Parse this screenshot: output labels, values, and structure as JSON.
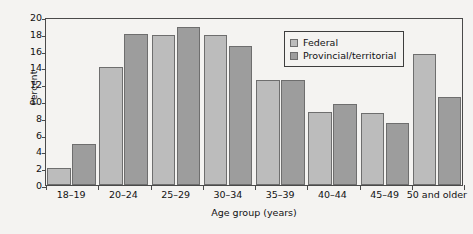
{
  "chart_data": {
    "type": "bar",
    "title": "",
    "subtitle": "",
    "xlabel": "Age group (years)",
    "ylabel": "Percent",
    "categories": [
      "18–19",
      "20–24",
      "25–29",
      "30–34",
      "35–39",
      "40–44",
      "45–49",
      "50 and older"
    ],
    "series": [
      {
        "name": "Federal",
        "color": "#bcbcbc",
        "values": [
          2.0,
          14.0,
          17.9,
          17.8,
          12.5,
          8.7,
          8.6,
          15.6
        ]
      },
      {
        "name": "Provincial/territorial",
        "color": "#9d9d9d",
        "values": [
          4.9,
          18.0,
          18.8,
          16.6,
          12.5,
          9.7,
          7.4,
          10.5
        ]
      }
    ],
    "ylim": [
      0,
      20
    ],
    "yticks": [
      0,
      2,
      4,
      6,
      8,
      10,
      12,
      14,
      16,
      18,
      20
    ],
    "ytick_labels": [
      "0",
      "2",
      "4",
      "6",
      "8",
      "10",
      "12",
      "14",
      "16",
      "18",
      "20"
    ],
    "grid": false,
    "legend_position": "upper right",
    "legend_entries": [
      "Federal",
      "Provincial/territorial"
    ],
    "background_color": "#f4f3f1",
    "axis_color": "#4a4a4a"
  }
}
